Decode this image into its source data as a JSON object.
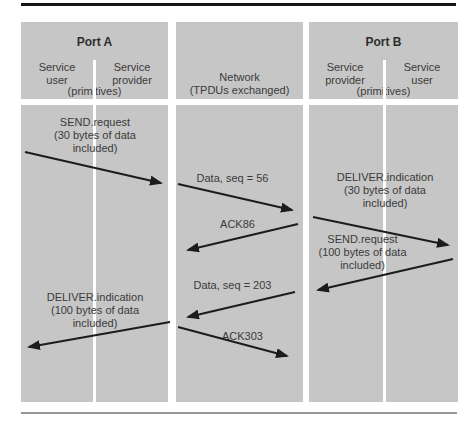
{
  "figure": {
    "columns": {
      "port_a": {
        "title": "Port A",
        "left_label": "Service user",
        "right_label": "Service provider",
        "sub_label": "(primitives)"
      },
      "network": {
        "title": "Network",
        "sub_label": "(TPDUs exchanged)"
      },
      "port_b": {
        "title": "Port B",
        "left_label": "Service provider",
        "right_label": "Service user",
        "sub_label": "(primitives)"
      }
    },
    "messages": {
      "a_send_request": "SEND.request\n(30 bytes of data\nincluded)",
      "net_data_56": "Data, seq = 56",
      "b_deliver_indication": "DELIVER.indication\n(30 bytes of data\nincluded)",
      "net_ack_86": "ACK86",
      "b_send_request": "SEND.request\n(100 bytes of data\nincluded)",
      "net_data_203": "Data, seq = 203",
      "a_deliver_indication": "DELIVER.indication\n(100 bytes of data\nincluded)",
      "net_ack_303": "ACK303"
    },
    "colors": {
      "column_bg": "#c6c6c6",
      "text": "#3a3a3a",
      "arrow": "#1c1c1c",
      "top_rule": "#161616",
      "bottom_rule": "#979797"
    }
  }
}
